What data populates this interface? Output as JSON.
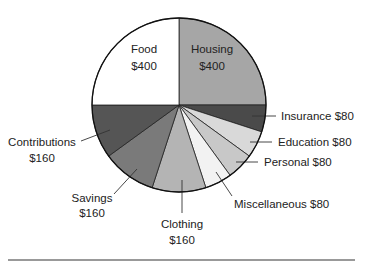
{
  "chart_data": {
    "type": "pie",
    "title": "",
    "start": "top",
    "direction": "clockwise",
    "total": 1600,
    "slices": [
      {
        "name": "Housing",
        "value": 400,
        "label_line1": "Housing",
        "label_line2": "$400",
        "color": "#a6a6a6",
        "label_inside": true
      },
      {
        "name": "Insurance",
        "value": 80,
        "label_line1": "Insurance $80",
        "label_line2": "",
        "color": "#4a4a4a",
        "label_inside": false
      },
      {
        "name": "Education",
        "value": 80,
        "label_line1": "Education $80",
        "label_line2": "",
        "color": "#d9d9d9",
        "label_inside": false
      },
      {
        "name": "Personal",
        "value": 80,
        "label_line1": "Personal $80",
        "label_line2": "",
        "color": "#c8c8c8",
        "label_inside": false
      },
      {
        "name": "Miscellaneous",
        "value": 80,
        "label_line1": "Miscellaneous $80",
        "label_line2": "",
        "color": "#f2f2f2",
        "label_inside": false
      },
      {
        "name": "Clothing",
        "value": 160,
        "label_line1": "Clothing",
        "label_line2": "$160",
        "color": "#b4b4b4",
        "label_inside": false
      },
      {
        "name": "Savings",
        "value": 160,
        "label_line1": "Savings",
        "label_line2": "$160",
        "color": "#7a7a7a",
        "label_inside": false
      },
      {
        "name": "Contributions",
        "value": 160,
        "label_line1": "Contributions",
        "label_line2": "$160",
        "color": "#555555",
        "label_inside": false
      },
      {
        "name": "Food",
        "value": 400,
        "label_line1": "Food",
        "label_line2": "$400",
        "color": "#ffffff",
        "label_inside": true
      }
    ]
  }
}
